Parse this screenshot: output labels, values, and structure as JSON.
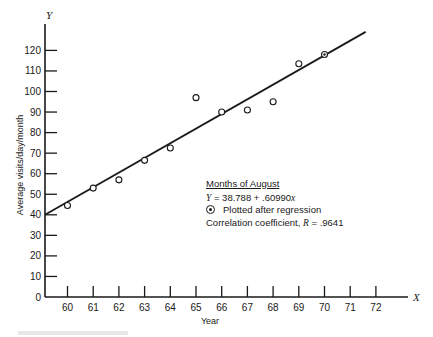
{
  "chart_data": {
    "type": "scatter",
    "title": "Months of August",
    "xlabel": "Year",
    "ylabel": "Average visits/day/month",
    "x_axis_letter": "X",
    "y_axis_letter": "Y",
    "x_ticks": [
      60,
      61,
      62,
      63,
      64,
      65,
      66,
      67,
      68,
      69,
      70,
      71,
      72
    ],
    "y_ticks": [
      0,
      10,
      20,
      30,
      40,
      50,
      60,
      70,
      80,
      90,
      100,
      110,
      120
    ],
    "xlim": [
      59.1,
      73.3
    ],
    "ylim": [
      0,
      128
    ],
    "grid": false,
    "series": [
      {
        "name": "Observed",
        "marker": "open-circle",
        "x": [
          60,
          61,
          62,
          63,
          64,
          65,
          66,
          67,
          68,
          69
        ],
        "y": [
          44.5,
          53,
          57,
          66.5,
          72.5,
          97,
          90,
          91,
          95,
          113.5
        ]
      },
      {
        "name": "Plotted after regression",
        "marker": "circle-dot",
        "x": [
          70
        ],
        "y": [
          118
        ]
      },
      {
        "name": "Regression line",
        "type": "line",
        "x": [
          59.1,
          71.6
        ],
        "y": [
          40,
          129
        ]
      }
    ],
    "regression": {
      "equation": "Y = 38.788 + .60990x",
      "intercept": 38.788,
      "slope": 0.6099
    },
    "correlation": 0.9641,
    "legend_position": "center-right"
  },
  "legend": {
    "title": "Months of August",
    "equation_lhs": "Y",
    "equation_rhs": " = 38.788 + .60990",
    "equation_var": "x",
    "symbol_label": "Plotted after regression",
    "correlation_prefix": "Correlation coefficient, ",
    "correlation_var": "R",
    "correlation_value": " = .9641"
  }
}
